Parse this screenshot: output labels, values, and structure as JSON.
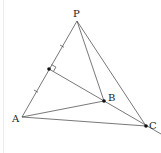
{
  "diagram": {
    "type": "geometry",
    "points": {
      "P": {
        "label": "P",
        "x": 77,
        "y": 21
      },
      "A": {
        "label": "A",
        "x": 22,
        "y": 117
      },
      "B": {
        "label": "B",
        "x": 104,
        "y": 101
      },
      "C": {
        "label": "C",
        "x": 146,
        "y": 126
      },
      "M": {
        "label": "",
        "x": 49,
        "y": 69
      }
    },
    "segments": [
      "PA",
      "PB",
      "PC",
      "AB",
      "AC",
      "MB",
      "BC"
    ],
    "marks": {
      "right_angle_at": "M",
      "equal_ticks": [
        "PM",
        "MA"
      ]
    },
    "colors": {
      "line": "#555555",
      "point": "#111111",
      "text": "#222222"
    }
  }
}
